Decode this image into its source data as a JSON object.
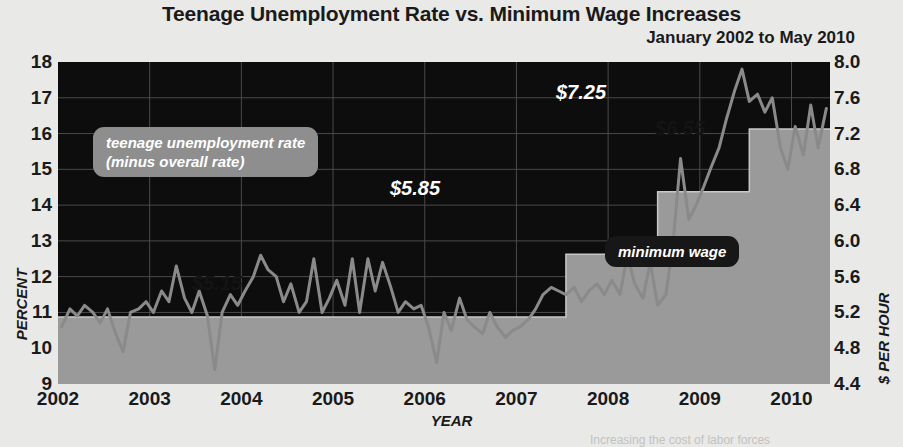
{
  "header": {
    "title": "Teenage Unemployment Rate vs. Minimum Wage Increases",
    "subtitle": "January 2002 to May 2010"
  },
  "footnote": "Increasing the cost of labor forces",
  "annotations": {
    "unemployment_badge": "teenage unemployment rate\n(minus overall rate)",
    "unemployment_badge_line1": "teenage unemployment rate",
    "unemployment_badge_line2": "(minus overall rate)",
    "wage_badge": "minimum wage",
    "wage_5_15": "$5.15",
    "wage_5_85": "$5.85",
    "wage_6_55": "$6.55",
    "wage_7_25": "$7.25"
  },
  "colors": {
    "plot_background": "#0d0d0d",
    "wage_area": "#9a9a9a",
    "unemployment_line": "#8a8a8a",
    "page_background": "#e9e9e7",
    "gridline": "#3a3a3a",
    "text": "#1a1a1a"
  },
  "chart_data": {
    "type": "line",
    "title": "Teenage Unemployment Rate vs. Minimum Wage Increases",
    "subtitle": "January 2002 to May 2010",
    "xlabel": "YEAR",
    "ylabel": "PERCENT",
    "y2label": "$ PER HOUR",
    "xlim": [
      2002.0,
      2010.42
    ],
    "ylim": [
      9,
      18
    ],
    "y2lim": [
      4.4,
      8.0
    ],
    "grid": true,
    "legend": "in-plot annotations",
    "xticks": [
      "2002",
      "2003",
      "2004",
      "2005",
      "2006",
      "2007",
      "2008",
      "2009",
      "2010"
    ],
    "xtick_values": [
      2002,
      2003,
      2004,
      2005,
      2006,
      2007,
      2008,
      2009,
      2010
    ],
    "yticks": [
      "9",
      "10",
      "11",
      "12",
      "13",
      "14",
      "15",
      "16",
      "17",
      "18"
    ],
    "ytick_values": [
      9,
      10,
      11,
      12,
      13,
      14,
      15,
      16,
      17,
      18
    ],
    "y2ticks": [
      "4.4",
      "4.8",
      "5.2",
      "5.6",
      "6.0",
      "6.4",
      "6.8",
      "7.2",
      "7.6",
      "8.0"
    ],
    "y2tick_values": [
      4.4,
      4.8,
      5.2,
      5.6,
      6.0,
      6.4,
      6.8,
      7.2,
      7.6,
      8.0
    ],
    "series": [
      {
        "name": "teenage unemployment rate (minus overall rate)",
        "axis": "left",
        "type": "line",
        "color": "#8a8a8a",
        "x": [
          2002.04,
          2002.13,
          2002.21,
          2002.29,
          2002.38,
          2002.46,
          2002.54,
          2002.63,
          2002.71,
          2002.79,
          2002.88,
          2002.96,
          2003.04,
          2003.13,
          2003.21,
          2003.29,
          2003.38,
          2003.46,
          2003.54,
          2003.63,
          2003.71,
          2003.79,
          2003.88,
          2003.96,
          2004.04,
          2004.13,
          2004.21,
          2004.29,
          2004.38,
          2004.46,
          2004.54,
          2004.63,
          2004.71,
          2004.79,
          2004.88,
          2004.96,
          2005.04,
          2005.13,
          2005.21,
          2005.29,
          2005.38,
          2005.46,
          2005.54,
          2005.63,
          2005.71,
          2005.79,
          2005.88,
          2005.96,
          2006.04,
          2006.13,
          2006.21,
          2006.29,
          2006.38,
          2006.46,
          2006.54,
          2006.63,
          2006.71,
          2006.79,
          2006.88,
          2006.96,
          2007.04,
          2007.13,
          2007.21,
          2007.29,
          2007.38,
          2007.46,
          2007.54,
          2007.63,
          2007.71,
          2007.79,
          2007.88,
          2007.96,
          2008.04,
          2008.13,
          2008.21,
          2008.29,
          2008.38,
          2008.46,
          2008.54,
          2008.63,
          2008.71,
          2008.79,
          2008.88,
          2008.96,
          2009.04,
          2009.13,
          2009.21,
          2009.29,
          2009.38,
          2009.46,
          2009.54,
          2009.63,
          2009.71,
          2009.79,
          2009.88,
          2009.96,
          2010.04,
          2010.13,
          2010.21,
          2010.29,
          2010.38
        ],
        "y": [
          10.6,
          11.1,
          10.9,
          11.2,
          11.0,
          10.7,
          11.1,
          10.4,
          9.9,
          11.0,
          11.1,
          11.3,
          11.0,
          11.6,
          11.3,
          12.3,
          11.4,
          11.0,
          11.6,
          10.9,
          9.4,
          11.0,
          11.5,
          11.2,
          11.6,
          12.0,
          12.6,
          12.2,
          12.0,
          11.3,
          11.8,
          11.0,
          11.3,
          12.5,
          11.0,
          11.4,
          11.9,
          11.2,
          12.5,
          11.0,
          12.5,
          11.6,
          12.4,
          11.7,
          11.0,
          11.3,
          11.1,
          11.2,
          10.6,
          9.6,
          11.0,
          10.5,
          11.4,
          10.8,
          10.6,
          10.4,
          11.0,
          10.6,
          10.3,
          10.5,
          10.6,
          10.8,
          11.1,
          11.5,
          11.7,
          11.6,
          11.5,
          11.7,
          11.3,
          11.6,
          11.8,
          11.5,
          11.9,
          11.5,
          12.6,
          11.8,
          11.4,
          12.4,
          11.2,
          11.5,
          13.0,
          15.3,
          13.6,
          14.0,
          14.5,
          15.1,
          15.6,
          16.4,
          17.2,
          17.8,
          16.9,
          17.1,
          16.6,
          17.0,
          15.6,
          15.0,
          16.2,
          15.4,
          16.8,
          15.6,
          16.7
        ]
      },
      {
        "name": "minimum wage",
        "axis": "right",
        "type": "step-area",
        "color": "#9a9a9a",
        "steps": [
          {
            "from": 2002.0,
            "to": 2007.54,
            "value": 5.15
          },
          {
            "from": 2007.54,
            "to": 2008.54,
            "value": 5.85
          },
          {
            "from": 2008.54,
            "to": 2009.54,
            "value": 6.55
          },
          {
            "from": 2009.54,
            "to": 2010.42,
            "value": 7.25
          }
        ]
      }
    ]
  }
}
